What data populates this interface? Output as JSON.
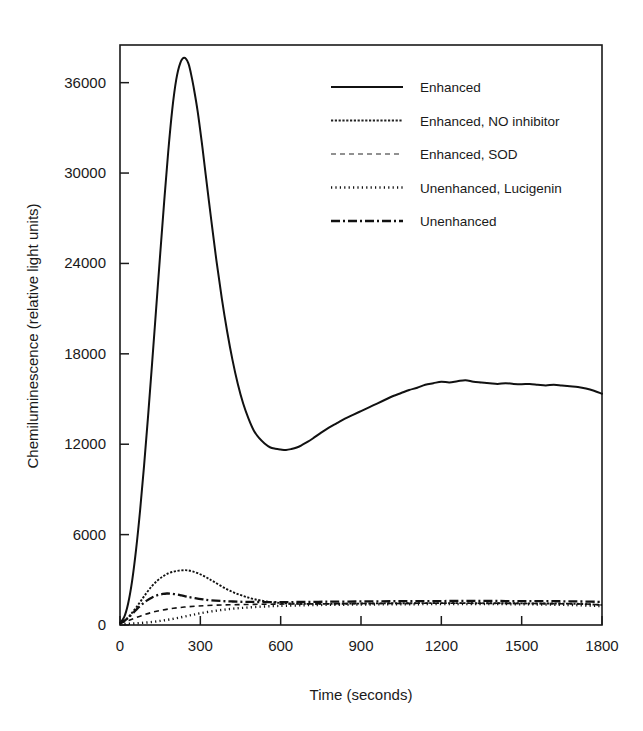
{
  "chart_data": {
    "type": "line",
    "title": "",
    "xlabel": "Time (seconds)",
    "ylabel": "Chemiluminescence (relative light units)",
    "xlim": [
      0,
      1800
    ],
    "ylim": [
      0,
      38500
    ],
    "xticks": [
      0,
      300,
      600,
      900,
      1200,
      1500,
      1800
    ],
    "yticks": [
      0,
      6000,
      12000,
      18000,
      24000,
      30000,
      36000
    ],
    "xtick_labels": [
      "0",
      "300",
      "600",
      "900",
      "1200",
      "1500",
      "1800"
    ],
    "ytick_labels": [
      "0",
      "6000",
      "12000",
      "18000",
      "24000",
      "30000",
      "36000"
    ],
    "grid": false,
    "legend_position": "upper-right",
    "frame_color": "#1a1a1a",
    "series": [
      {
        "name": "Enhanced",
        "style": "solid",
        "color": "#111111",
        "width": 2.0,
        "dash": "",
        "x": [
          0,
          15,
          30,
          45,
          60,
          75,
          90,
          105,
          120,
          135,
          150,
          165,
          180,
          195,
          210,
          225,
          240,
          255,
          265,
          275,
          290,
          305,
          320,
          340,
          360,
          380,
          400,
          420,
          440,
          460,
          480,
          500,
          520,
          540,
          560,
          580,
          600,
          620,
          640,
          660,
          680,
          700,
          720,
          750,
          780,
          810,
          840,
          870,
          900,
          930,
          960,
          990,
          1020,
          1050,
          1080,
          1110,
          1140,
          1170,
          1200,
          1230,
          1260,
          1290,
          1320,
          1350,
          1380,
          1410,
          1440,
          1470,
          1500,
          1530,
          1560,
          1590,
          1620,
          1650,
          1680,
          1710,
          1740,
          1770,
          1800
        ],
        "y": [
          150,
          500,
          1400,
          2900,
          5000,
          7600,
          10600,
          13900,
          17400,
          21000,
          24600,
          28100,
          31400,
          34200,
          36200,
          37300,
          37650,
          37300,
          36600,
          35700,
          34100,
          32100,
          29900,
          27000,
          24200,
          21700,
          19500,
          17600,
          16000,
          14700,
          13700,
          12900,
          12400,
          12050,
          11800,
          11700,
          11650,
          11620,
          11680,
          11780,
          11950,
          12150,
          12380,
          12750,
          13100,
          13400,
          13700,
          13950,
          14200,
          14450,
          14700,
          14950,
          15200,
          15400,
          15600,
          15750,
          15950,
          16050,
          16150,
          16100,
          16180,
          16250,
          16150,
          16100,
          16050,
          16000,
          16050,
          16000,
          15980,
          16000,
          15950,
          15900,
          15950,
          15900,
          15850,
          15800,
          15700,
          15550,
          15350
        ]
      },
      {
        "name": "Enhanced, NO inhibitor",
        "style": "fine-dotted",
        "color": "#222222",
        "width": 1.9,
        "dash": "2.2,1.6",
        "x": [
          0,
          20,
          40,
          60,
          80,
          100,
          120,
          140,
          160,
          180,
          200,
          220,
          240,
          255,
          270,
          290,
          310,
          330,
          350,
          380,
          410,
          440,
          470,
          500,
          540,
          580,
          620,
          660,
          700,
          760,
          820,
          880,
          940,
          1000,
          1060,
          1120,
          1180,
          1240,
          1300,
          1360,
          1420,
          1480,
          1540,
          1600,
          1660,
          1720,
          1800
        ],
        "y": [
          120,
          320,
          700,
          1150,
          1650,
          2150,
          2600,
          2950,
          3220,
          3420,
          3540,
          3610,
          3640,
          3620,
          3560,
          3440,
          3280,
          3080,
          2880,
          2560,
          2280,
          2050,
          1870,
          1720,
          1580,
          1490,
          1440,
          1410,
          1400,
          1400,
          1410,
          1420,
          1430,
          1440,
          1440,
          1450,
          1450,
          1450,
          1450,
          1440,
          1440,
          1440,
          1430,
          1430,
          1420,
          1400,
          1330
        ]
      },
      {
        "name": "Enhanced,  SOD",
        "style": "short-dash",
        "color": "#6e6e6e",
        "width": 1.6,
        "dash": "5,4",
        "x": [
          0,
          40,
          80,
          120,
          160,
          200,
          240,
          280,
          320,
          380,
          440,
          500,
          560,
          620,
          700,
          780,
          860,
          940,
          1020,
          1100,
          1180,
          1260,
          1340,
          1420,
          1500,
          1580,
          1660,
          1740,
          1800
        ],
        "y": [
          100,
          350,
          620,
          840,
          1000,
          1110,
          1190,
          1250,
          1290,
          1330,
          1350,
          1370,
          1380,
          1390,
          1400,
          1410,
          1420,
          1430,
          1430,
          1440,
          1440,
          1440,
          1440,
          1440,
          1430,
          1420,
          1410,
          1390,
          1330
        ]
      },
      {
        "name": "Unenhanced, Lucigenin",
        "style": "bold-dotted",
        "color": "#111111",
        "width": 2.4,
        "dash": "1.2,3.2",
        "x": [
          0,
          30,
          60,
          90,
          120,
          150,
          180,
          210,
          240,
          270,
          300,
          340,
          380,
          420,
          460,
          500,
          540,
          580,
          620,
          680,
          740,
          800,
          860,
          920,
          980,
          1040,
          1100,
          1160,
          1220,
          1280,
          1340,
          1400,
          1460,
          1520,
          1580,
          1640,
          1700,
          1760,
          1800
        ],
        "y": [
          60,
          80,
          110,
          150,
          200,
          270,
          350,
          450,
          560,
          670,
          780,
          900,
          1000,
          1080,
          1140,
          1190,
          1230,
          1260,
          1280,
          1310,
          1330,
          1340,
          1350,
          1360,
          1370,
          1380,
          1380,
          1390,
          1390,
          1390,
          1390,
          1390,
          1380,
          1370,
          1360,
          1340,
          1320,
          1280,
          1250
        ]
      },
      {
        "name": "Unenhanced",
        "style": "dash-dot",
        "color": "#111111",
        "width": 2.3,
        "dash": "9,3,2,3",
        "x": [
          0,
          20,
          40,
          60,
          80,
          100,
          120,
          140,
          160,
          175,
          190,
          210,
          230,
          250,
          280,
          310,
          340,
          380,
          420,
          460,
          500,
          560,
          620,
          680,
          740,
          800,
          880,
          960,
          1040,
          1120,
          1200,
          1280,
          1360,
          1440,
          1520,
          1600,
          1680,
          1760,
          1800
        ],
        "y": [
          110,
          320,
          640,
          1000,
          1340,
          1620,
          1830,
          1980,
          2060,
          2090,
          2080,
          2030,
          1960,
          1880,
          1780,
          1700,
          1640,
          1590,
          1560,
          1540,
          1530,
          1520,
          1520,
          1530,
          1540,
          1550,
          1560,
          1570,
          1580,
          1590,
          1590,
          1600,
          1600,
          1590,
          1590,
          1580,
          1570,
          1550,
          1530
        ]
      }
    ],
    "legend": [
      {
        "label": "Enhanced",
        "style": "solid"
      },
      {
        "label": "Enhanced, NO inhibitor",
        "style": "fine-dotted"
      },
      {
        "label": "Enhanced,  SOD",
        "style": "short-dash"
      },
      {
        "label": "Unenhanced, Lucigenin",
        "style": "bold-dotted"
      },
      {
        "label": "Unenhanced",
        "style": "dash-dot"
      }
    ]
  }
}
